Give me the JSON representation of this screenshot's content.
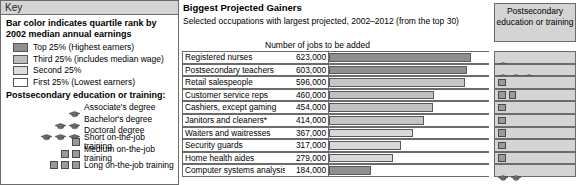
{
  "key": {
    "header": "Key",
    "title": "Bar color indicates quartile rank by 2002 median annual earnings",
    "quartiles": [
      {
        "label": "Top 25% (Highest earners)",
        "color": "#8f8f8f"
      },
      {
        "label": "Third 25% (includes median wage)",
        "color": "#bdbdbd"
      },
      {
        "label": "Second 25%",
        "color": "#dedede"
      },
      {
        "label": "First 25% (Lowest earners)",
        "color": "#ffffff"
      }
    ],
    "training_title": "Postsecondary education or training:",
    "training": [
      {
        "label": "Associate's degree",
        "icon": "mortarboard-icon",
        "count": 1
      },
      {
        "label": "Bachelor's degree",
        "icon": "mortarboard-icon",
        "count": 2
      },
      {
        "label": "Doctoral degree",
        "icon": "mortarboard-icon",
        "count": 3
      },
      {
        "label": "Short on-the-job training",
        "icon": "square-icon",
        "count": 1
      },
      {
        "label": "Medium on-the-job training",
        "icon": "square-icon",
        "count": 2
      },
      {
        "label": "Long on-the-job training",
        "icon": "square-icon",
        "count": 3
      }
    ]
  },
  "chart": {
    "title": "Biggest Projected Gainers",
    "subtitle": "Selected occupations with largest projected, 2002–2012 (from the top 30)",
    "bar_axis_label": "Number of jobs to be added",
    "edu_column_header": "Postsecondary education or training",
    "footnote_marker": "*"
  },
  "chart_data": {
    "type": "bar",
    "title": "Biggest Projected Gainers",
    "subtitle": "Selected occupations with largest projected, 2002–2012 (from the top 30)",
    "xlabel": "Number of jobs to be added",
    "ylabel": "",
    "xlim": [
      0,
      700000
    ],
    "grid": false,
    "legend": "Bar color indicates quartile rank by 2002 median annual earnings",
    "categories": [
      "Registered nurses",
      "Postsecondary teachers",
      "Retail salespeople",
      "Customer service reps",
      "Cashiers, except gaming",
      "Janitors and cleaners*",
      "Waiters and waitresses",
      "Security guards",
      "Home health aides",
      "Computer systems analysis"
    ],
    "values": [
      623000,
      603000,
      596000,
      460000,
      454000,
      414000,
      367000,
      317000,
      279000,
      184000
    ],
    "value_labels": [
      "623,000",
      "603,000",
      "596,000",
      "460,000",
      "454,000",
      "414,000",
      "367,000",
      "317,000",
      "279,000",
      "184,000"
    ],
    "bar_colors": [
      "#8f8f8f",
      "#8f8f8f",
      "#c6c6c6",
      "#c1c1c1",
      "#c1c1c1",
      "#c6c6c6",
      "#d8d8d8",
      "#d8d8d8",
      "#d8d8d8",
      "#8f8f8f"
    ],
    "quartile_rank": [
      "Top 25%",
      "Top 25%",
      "Third 25%",
      "Third 25%",
      "Third 25%",
      "Third 25%",
      "Second 25%",
      "Second 25%",
      "Second 25%",
      "Top 25%"
    ],
    "education": [
      {
        "icon": "mortarboard-icon",
        "count": 1,
        "label": "Associate's degree"
      },
      {
        "icon": "mortarboard-icon",
        "count": 3,
        "label": "Doctoral degree"
      },
      {
        "icon": "square-icon",
        "count": 1,
        "label": "Short on-the-job training"
      },
      {
        "icon": "square-icon",
        "count": 2,
        "label": "Medium on-the-job training"
      },
      {
        "icon": "square-icon",
        "count": 1,
        "label": "Short on-the-job training"
      },
      {
        "icon": "square-icon",
        "count": 1,
        "label": "Short on-the-job training"
      },
      {
        "icon": "square-icon",
        "count": 1,
        "label": "Short on-the-job training"
      },
      {
        "icon": "square-icon",
        "count": 1,
        "label": "Short on-the-job training"
      },
      {
        "icon": "square-icon",
        "count": 1,
        "label": "Short on-the-job training"
      },
      {
        "icon": "mortarboard-icon",
        "count": 2,
        "label": "Bachelor's degree"
      }
    ]
  }
}
